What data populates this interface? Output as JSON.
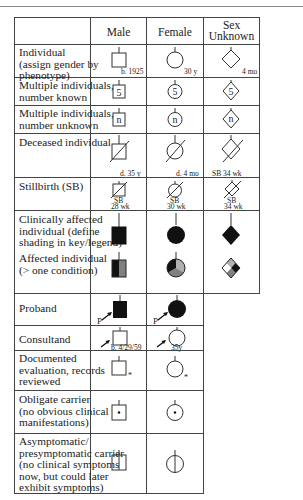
{
  "header_cut_text": "",
  "columns": {
    "label": "",
    "male": "Male",
    "female": "Female",
    "unknown_line1": "Sex",
    "unknown_line2": "Unknown"
  },
  "rows": [
    {
      "label": [
        "Individual",
        "(assign gender by",
        "phenotype)"
      ],
      "notes": {
        "male": "b. 1925",
        "female": "30 y",
        "unknown": "4 mo"
      }
    },
    {
      "label": [
        "Multiple individuals,",
        "number known"
      ],
      "symbol_text": "5"
    },
    {
      "label": [
        "Multiple individuals,",
        "number unknown"
      ],
      "symbol_text": "n"
    },
    {
      "label": [
        "Deceased individual"
      ],
      "notes": {
        "male": "d. 35 y",
        "female": "d. 4 mo",
        "unknown": "SB 34 wk"
      }
    },
    {
      "label": [
        "Stillbirth (SB)"
      ],
      "notes": {
        "male_1": "SB",
        "male_2": "28 wk",
        "female_1": "SB",
        "female_2": "30 wk",
        "unknown_1": "SB",
        "unknown_2": "34 wk"
      }
    },
    {
      "label": [
        "Clinically affected",
        "individual (define",
        "shading in key/legend)"
      ]
    },
    {
      "label": [
        "Affected individual",
        "(> one condition)"
      ]
    },
    {
      "label": [
        "Proband"
      ],
      "marker": "P"
    },
    {
      "label": [
        "Consultand"
      ],
      "notes": {
        "male": "b. 4/29/59",
        "female": "35y"
      }
    },
    {
      "label": [
        "Documented",
        "evaluation, records",
        "reviewed"
      ],
      "marker": "*"
    },
    {
      "label": [
        "Obligate carrier",
        "(no obvious clinical",
        "manifestations)"
      ]
    },
    {
      "label": [
        "Asymptomatic/",
        "presymptomatic carrier",
        "(no clinical symptoms",
        "now, but could later",
        "exhibit symptoms)"
      ]
    }
  ],
  "colors": {
    "line": "#444444",
    "affected": "#111111",
    "gray": "#808080",
    "lightgray": "#b0b0b0"
  }
}
